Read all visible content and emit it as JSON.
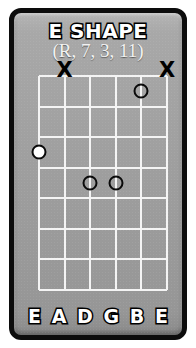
{
  "diagram": {
    "title": "E SHAPE",
    "subtitle": "(R, 7, 3, 11)",
    "type": "guitar-chord-shape-diagram",
    "colors": {
      "card_background": "#9e9e9e",
      "border": "#0c0c0c",
      "grid_line": "#f4f4f4",
      "text": "#ffffff",
      "text_outline": "#000000",
      "marker_outline": "#0a0a0a",
      "root_fill": "#ffffff"
    },
    "fretboard": {
      "string_count": 6,
      "fret_count": 7,
      "string_labels": [
        "E",
        "A",
        "D",
        "G",
        "B",
        "E"
      ],
      "muted_strings": [
        {
          "string_index": 1,
          "label": "A",
          "marker": "x"
        },
        {
          "string_index": 5,
          "label": "E",
          "marker": "x"
        }
      ],
      "notes": [
        {
          "string_index": 4,
          "string_label": "B",
          "fret": 1,
          "marker": "open-circle",
          "degree": "7"
        },
        {
          "string_index": 0,
          "string_label": "E",
          "fret": 3,
          "marker": "filled-circle",
          "degree": "R"
        },
        {
          "string_index": 2,
          "string_label": "D",
          "fret": 4,
          "marker": "open-circle",
          "degree": "3"
        },
        {
          "string_index": 3,
          "string_label": "G",
          "fret": 4,
          "marker": "open-circle",
          "degree": "11"
        }
      ],
      "intervals": [
        "R",
        "7",
        "3",
        "11"
      ]
    }
  }
}
